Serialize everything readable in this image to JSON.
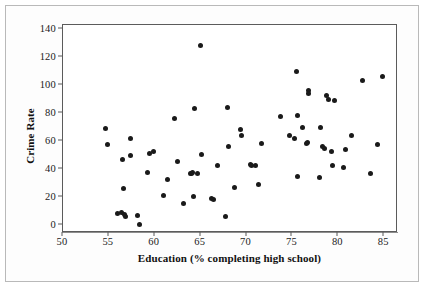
{
  "chart_data": {
    "type": "scatter",
    "title": "",
    "xlabel": "Education (% completing high school)",
    "ylabel": "Crime Rate",
    "xlim": [
      50,
      86.5
    ],
    "ylim": [
      -6,
      143
    ],
    "xticks": [
      50,
      55,
      60,
      65,
      70,
      75,
      80,
      85
    ],
    "xtick_labels": [
      "50",
      "55",
      "60",
      "65",
      "70",
      "75",
      "80",
      "85"
    ],
    "yticks": [
      0,
      20,
      40,
      60,
      80,
      100,
      120,
      140
    ],
    "ytick_labels": [
      "0",
      "20",
      "40",
      "60",
      "80",
      "100",
      "120",
      "140"
    ],
    "grid": false,
    "legend": null,
    "marker": {
      "shape": "circle",
      "color": "#1a1a1a",
      "size_px": 5
    },
    "n_points": 69,
    "points": [
      {
        "x": 54.6,
        "y": 68.8
      },
      {
        "x": 54.8,
        "y": 57.2
      },
      {
        "x": 55.9,
        "y": 8.3
      },
      {
        "x": 56.4,
        "y": 8.9
      },
      {
        "x": 56.5,
        "y": 46.9
      },
      {
        "x": 56.6,
        "y": 25.6
      },
      {
        "x": 56.7,
        "y": 7.4
      },
      {
        "x": 56.8,
        "y": 5.6
      },
      {
        "x": 57.3,
        "y": 61.7
      },
      {
        "x": 57.4,
        "y": 49.2
      },
      {
        "x": 58.1,
        "y": 6.3
      },
      {
        "x": 58.3,
        "y": -0.2
      },
      {
        "x": 59.2,
        "y": 37.0
      },
      {
        "x": 59.4,
        "y": 51.3
      },
      {
        "x": 59.9,
        "y": 52.1
      },
      {
        "x": 61.0,
        "y": 21.2
      },
      {
        "x": 61.4,
        "y": 32.1
      },
      {
        "x": 62.1,
        "y": 76.2
      },
      {
        "x": 62.5,
        "y": 44.9
      },
      {
        "x": 63.1,
        "y": 15.3
      },
      {
        "x": 63.9,
        "y": 36.8
      },
      {
        "x": 64.0,
        "y": 36.4
      },
      {
        "x": 64.1,
        "y": 37.1
      },
      {
        "x": 64.2,
        "y": 19.9
      },
      {
        "x": 64.3,
        "y": 82.9
      },
      {
        "x": 65.0,
        "y": 128.0
      },
      {
        "x": 65.1,
        "y": 50.2
      },
      {
        "x": 66.2,
        "y": 18.9
      },
      {
        "x": 66.4,
        "y": 17.8
      },
      {
        "x": 66.8,
        "y": 42.3
      },
      {
        "x": 67.7,
        "y": 6.0
      },
      {
        "x": 67.9,
        "y": 83.9
      },
      {
        "x": 68.0,
        "y": 55.9
      },
      {
        "x": 68.7,
        "y": 26.8
      },
      {
        "x": 69.3,
        "y": 68.2
      },
      {
        "x": 69.5,
        "y": 64.0
      },
      {
        "x": 70.4,
        "y": 43.3
      },
      {
        "x": 70.5,
        "y": 42.7
      },
      {
        "x": 71.0,
        "y": 42.4
      },
      {
        "x": 71.3,
        "y": 28.9
      },
      {
        "x": 71.6,
        "y": 58.0
      },
      {
        "x": 73.7,
        "y": 77.5
      },
      {
        "x": 74.7,
        "y": 63.6
      },
      {
        "x": 75.2,
        "y": 61.9
      },
      {
        "x": 75.4,
        "y": 110.0
      },
      {
        "x": 75.5,
        "y": 78.4
      },
      {
        "x": 75.6,
        "y": 34.8
      },
      {
        "x": 76.1,
        "y": 69.9
      },
      {
        "x": 76.5,
        "y": 58.4
      },
      {
        "x": 76.6,
        "y": 58.9
      },
      {
        "x": 76.7,
        "y": 95.8
      },
      {
        "x": 76.8,
        "y": 93.8
      },
      {
        "x": 78.0,
        "y": 33.9
      },
      {
        "x": 78.1,
        "y": 69.6
      },
      {
        "x": 78.3,
        "y": 55.8
      },
      {
        "x": 78.5,
        "y": 54.6
      },
      {
        "x": 78.7,
        "y": 92.6
      },
      {
        "x": 78.9,
        "y": 89.4
      },
      {
        "x": 79.3,
        "y": 52.7
      },
      {
        "x": 79.4,
        "y": 42.6
      },
      {
        "x": 79.6,
        "y": 88.6
      },
      {
        "x": 80.6,
        "y": 41.0
      },
      {
        "x": 80.8,
        "y": 53.5
      },
      {
        "x": 81.4,
        "y": 63.6
      },
      {
        "x": 82.6,
        "y": 103.2
      },
      {
        "x": 83.5,
        "y": 36.8
      },
      {
        "x": 84.3,
        "y": 57.4
      },
      {
        "x": 84.8,
        "y": 106.3
      },
      {
        "x": 64.6,
        "y": 36.6
      }
    ]
  }
}
